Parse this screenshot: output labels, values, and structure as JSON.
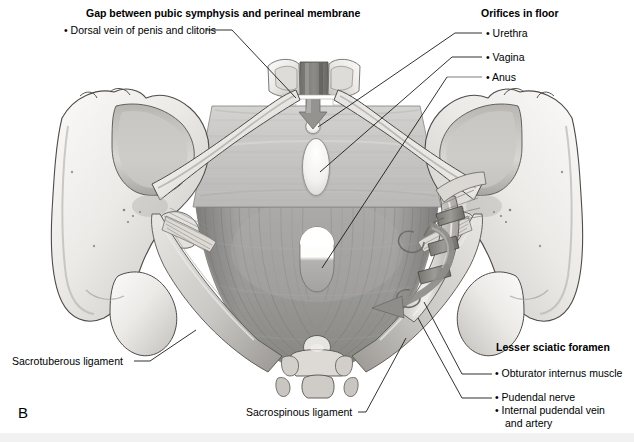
{
  "figure": {
    "panel_letter": "B",
    "background": "#ffffff"
  },
  "labels": {
    "gap_heading": "Gap between pubic symphysis and perineal membrane",
    "dorsal_vein": "• Dorsal vein of penis and clitoris",
    "orifices_heading": "Orifices in floor",
    "urethra": "• Urethra",
    "vagina": "• Vagina",
    "anus": "• Anus",
    "lesser_sciatic_heading": "Lesser sciatic foramen",
    "obturator_internus": "• Obturator internus muscle",
    "pudendal_nerve": "• Pudendal nerve",
    "internal_pudendal": "• Internal pudendal vein",
    "internal_pudendal_cont": "and artery",
    "sacrotuberous": "Sacrotuberous ligament",
    "sacrospinous": "Sacrospinous ligament"
  },
  "colors": {
    "bone_light": "#f3f2f0",
    "bone_mid": "#d8d6d3",
    "bone_shadow": "#9b9894",
    "perineal_membrane": "#c6c5c3",
    "levator_ani": "#9d9c9a",
    "levator_ani_dark": "#7e7d7b",
    "arrow_gray": "#8e8d8b",
    "orifice_white": "#ffffff",
    "leader_line": "#1a1a1a",
    "bottom_band": "#f1f1f1"
  },
  "structures": {
    "perineal_membrane": "perineal-membrane-trapezoid",
    "levator_ani": "levator-ani-muscle",
    "pubic_symphysis": "pubic-symphysis",
    "coccyx": "coccyx",
    "left_hip_bone": "left-hip-bone",
    "right_hip_bone": "right-hip-bone",
    "sacrotuberous_ligament": "sacrotuberous-ligament",
    "sacrospinous_ligament": "sacrospinous-ligament",
    "obturator_internus_tendon": "obturator-internus-tendon",
    "dorsal_vein_arrow": "dorsal-vein-direction-arrow",
    "pudendal_canal_arrow": "pudendal-canal-curved-arrow"
  }
}
